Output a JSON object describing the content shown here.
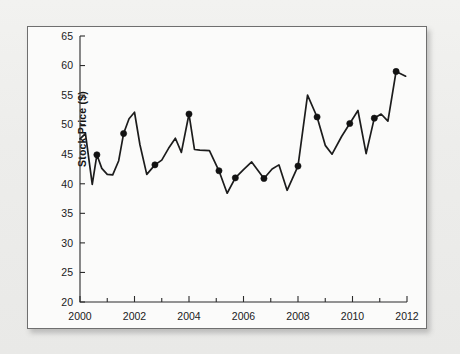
{
  "figure": {
    "name": "stock-price-time-series",
    "background_color": "#fbfbfa",
    "page_color": "#eeeeec",
    "border_color": "#6f6f6f",
    "line_color": "#1c1c1c",
    "marker_color": "#121212"
  },
  "chart_data": {
    "type": "line",
    "title": "",
    "xlabel": "",
    "ylabel": "Stock Price ($)",
    "xlim": [
      2000,
      2012
    ],
    "ylim": [
      20,
      65
    ],
    "grid": false,
    "legend": null,
    "x_ticks": [
      2000,
      2002,
      2004,
      2006,
      2008,
      2010,
      2012
    ],
    "x_tick_labels": [
      "2000",
      "2002",
      "2004",
      "2006",
      "2008",
      "2010",
      "2012"
    ],
    "x_minor_ticks": [
      2001,
      2003,
      2005,
      2007,
      2009,
      2011
    ],
    "y_ticks": [
      20,
      25,
      30,
      35,
      40,
      45,
      50,
      55,
      60,
      65
    ],
    "y_tick_labels": [
      "20",
      "25",
      "30",
      "35",
      "40",
      "45",
      "50",
      "55",
      "60",
      "65"
    ],
    "series": [
      {
        "name": "Stock Price",
        "x": [
          2000.0,
          2000.2,
          2000.45,
          2000.62,
          2000.8,
          2001.0,
          2001.2,
          2001.42,
          2001.6,
          2001.8,
          2002.0,
          2002.2,
          2002.45,
          2002.75,
          2003.0,
          2003.25,
          2003.5,
          2003.72,
          2004.0,
          2004.2,
          2004.4,
          2004.75,
          2005.1,
          2005.4,
          2005.7,
          2006.0,
          2006.3,
          2006.75,
          2007.05,
          2007.3,
          2007.6,
          2008.0,
          2008.35,
          2008.7,
          2009.0,
          2009.25,
          2009.6,
          2009.9,
          2010.2,
          2010.5,
          2010.8,
          2011.05,
          2011.3,
          2011.6,
          2011.95
        ],
        "y": [
          47.6,
          48.5,
          39.9,
          44.9,
          42.6,
          41.6,
          41.5,
          43.9,
          48.5,
          51.0,
          52.1,
          46.6,
          41.6,
          43.2,
          44.0,
          46.0,
          47.7,
          45.3,
          51.8,
          45.8,
          45.7,
          45.6,
          42.2,
          38.4,
          41.0,
          42.4,
          43.7,
          40.9,
          42.5,
          43.2,
          38.9,
          43.0,
          55.0,
          51.3,
          46.5,
          45.0,
          48.0,
          50.2,
          52.4,
          45.1,
          51.1,
          51.8,
          50.6,
          59.0,
          58.2
        ],
        "marker_indices": [
          3,
          8,
          13,
          18,
          22,
          24,
          27,
          31,
          33,
          37,
          40,
          43
        ]
      }
    ]
  }
}
